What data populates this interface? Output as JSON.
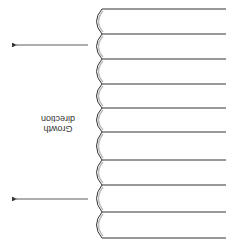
{
  "diagram": {
    "orientation": "rotated-180",
    "label": {
      "line1": "Growth",
      "line2": "direction"
    },
    "lamellae": {
      "count": 9,
      "boundary_y": [
        9,
        34,
        59,
        84,
        108,
        132,
        160,
        185,
        212,
        238
      ],
      "left_x": 100,
      "right_x": 226
    },
    "arrows": [
      {
        "y": 45,
        "x_start": 88,
        "x_end": 12
      },
      {
        "y": 199,
        "x_start": 88,
        "x_end": 12
      }
    ],
    "colors": {
      "line": "#333333",
      "shade": "#bdbdbd",
      "background": "#ffffff"
    }
  }
}
